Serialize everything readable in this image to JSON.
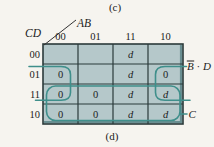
{
  "captions": {
    "top": "(c)",
    "bottom": "(d)"
  },
  "kmap": {
    "col_var": "AB",
    "row_var": "CD",
    "col_headers": [
      "00",
      "01",
      "11",
      "10"
    ],
    "row_headers": [
      "00",
      "01",
      "11",
      "10"
    ],
    "cells": [
      [
        "",
        "",
        "d",
        ""
      ],
      [
        "0",
        "",
        "d",
        "0"
      ],
      [
        "0",
        "0",
        "d",
        "d"
      ],
      [
        "0",
        "0",
        "d",
        "d"
      ]
    ],
    "groups": {
      "bd_label": {
        "var1": "B",
        "var1_overbar": true,
        "operator": " · ",
        "var2": "D"
      },
      "c_label": "C"
    },
    "colors": {
      "cell_fill": "#b5c8ca",
      "loop_stroke": "#3f8f8b",
      "grid_stroke": "#2b3a3a",
      "edge_shade": "#5d8488"
    }
  }
}
